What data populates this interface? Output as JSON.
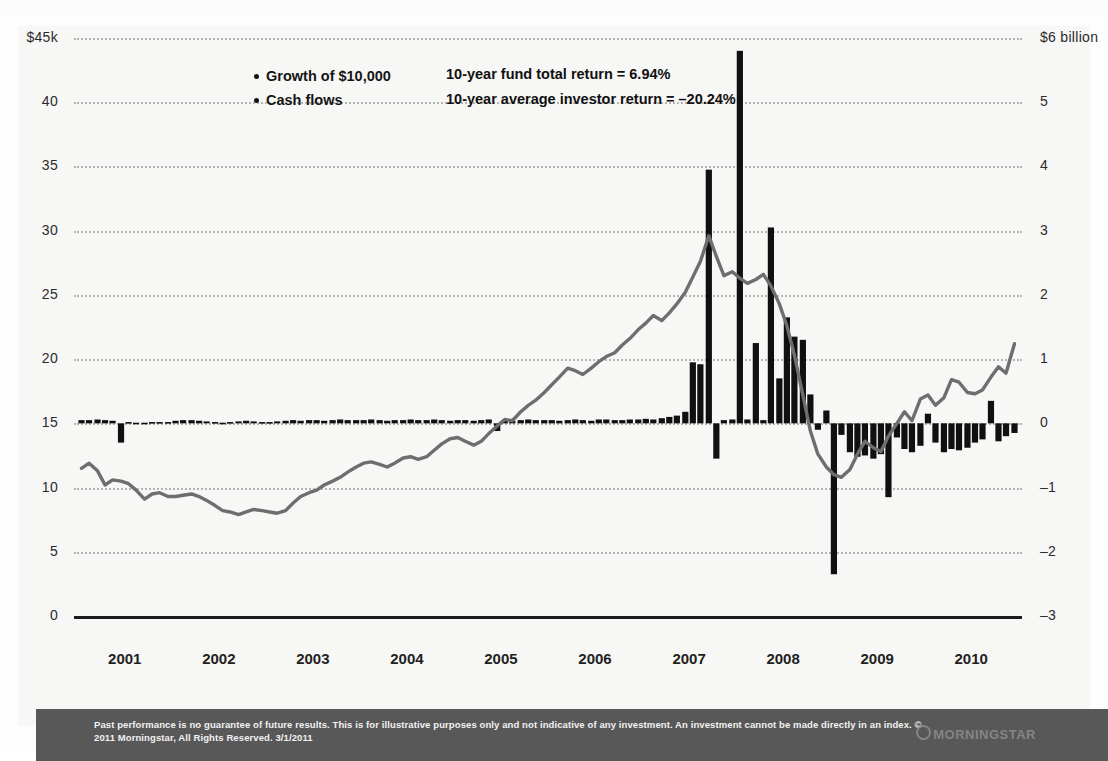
{
  "legend": {
    "items": [
      {
        "label": "Growth of $10,000"
      },
      {
        "label": "Cash flows"
      }
    ]
  },
  "stats": {
    "fund_return": "10-year fund total return = 6.94%",
    "investor_return": "10-year average investor return = –20.24%"
  },
  "footer": {
    "disclaimer": "Past performance is no guarantee of future results. This is for illustrative purposes only and not indicative of any investment. An investment cannot be made directly in an index. © 2011 Morningstar, All Rights Reserved. 3/1/2011",
    "logo": "MORNINGSTAR"
  },
  "chart_data": {
    "type": "line",
    "title": "",
    "xlabel": "",
    "ylabel": "",
    "grid": true,
    "legend_position": "top-left",
    "x": [
      "2001",
      "2002",
      "2003",
      "2004",
      "2005",
      "2006",
      "2007",
      "2008",
      "2009",
      "2010"
    ],
    "xlim": [
      2000.92,
      2011.0
    ],
    "axis_left": {
      "label": "$45k",
      "ticks": [
        "$45k",
        "40",
        "35",
        "30",
        "25",
        "20",
        "15",
        "10",
        "5",
        "0"
      ],
      "tick_values": [
        45,
        40,
        35,
        30,
        25,
        20,
        15,
        10,
        5,
        0
      ],
      "ylim": [
        0,
        45
      ]
    },
    "axis_right": {
      "label": "$6 billion",
      "ticks": [
        "$6 billion",
        "5",
        "4",
        "3",
        "2",
        "1",
        "0",
        "–1",
        "–2",
        "–3"
      ],
      "tick_values": [
        6,
        5,
        4,
        3,
        2,
        1,
        0,
        -1,
        -2,
        -3
      ],
      "ylim": [
        -3,
        6
      ]
    },
    "series": [
      {
        "name": "Growth of $10,000",
        "type": "line",
        "axis": "left",
        "color": "#6e6e6e",
        "x": [
          2001.0,
          2001.08,
          2001.17,
          2001.25,
          2001.33,
          2001.42,
          2001.5,
          2001.58,
          2001.67,
          2001.75,
          2001.83,
          2001.92,
          2002.0,
          2002.08,
          2002.17,
          2002.25,
          2002.33,
          2002.42,
          2002.5,
          2002.58,
          2002.67,
          2002.75,
          2002.83,
          2002.92,
          2003.0,
          2003.08,
          2003.17,
          2003.25,
          2003.33,
          2003.42,
          2003.5,
          2003.58,
          2003.67,
          2003.75,
          2003.83,
          2003.92,
          2004.0,
          2004.08,
          2004.17,
          2004.25,
          2004.33,
          2004.42,
          2004.5,
          2004.58,
          2004.67,
          2004.75,
          2004.83,
          2004.92,
          2005.0,
          2005.08,
          2005.17,
          2005.25,
          2005.33,
          2005.42,
          2005.5,
          2005.58,
          2005.67,
          2005.75,
          2005.83,
          2005.92,
          2006.0,
          2006.08,
          2006.17,
          2006.25,
          2006.33,
          2006.42,
          2006.5,
          2006.58,
          2006.67,
          2006.75,
          2006.83,
          2006.92,
          2007.0,
          2007.08,
          2007.17,
          2007.25,
          2007.33,
          2007.42,
          2007.5,
          2007.58,
          2007.67,
          2007.75,
          2007.83,
          2007.92,
          2008.0,
          2008.08,
          2008.17,
          2008.25,
          2008.33,
          2008.42,
          2008.5,
          2008.58,
          2008.67,
          2008.75,
          2008.83,
          2008.92,
          2009.0,
          2009.08,
          2009.17,
          2009.25,
          2009.33,
          2009.42,
          2009.5,
          2009.58,
          2009.67,
          2009.75,
          2009.83,
          2009.92,
          2010.0,
          2010.08,
          2010.17,
          2010.25,
          2010.33,
          2010.42,
          2010.5,
          2010.58,
          2010.67,
          2010.75,
          2010.83,
          2010.92
        ],
        "y": [
          11.5,
          11.9,
          11.3,
          10.2,
          10.6,
          10.5,
          10.3,
          9.8,
          9.1,
          9.5,
          9.6,
          9.3,
          9.3,
          9.4,
          9.5,
          9.3,
          9.0,
          8.6,
          8.2,
          8.1,
          7.9,
          8.1,
          8.3,
          8.2,
          8.1,
          8.0,
          8.2,
          8.8,
          9.3,
          9.6,
          9.8,
          10.2,
          10.5,
          10.8,
          11.2,
          11.6,
          11.9,
          12.0,
          11.8,
          11.6,
          11.9,
          12.3,
          12.4,
          12.2,
          12.4,
          12.9,
          13.4,
          13.8,
          13.9,
          13.6,
          13.3,
          13.6,
          14.2,
          14.8,
          15.3,
          15.2,
          15.9,
          16.4,
          16.8,
          17.4,
          18.0,
          18.6,
          19.3,
          19.1,
          18.8,
          19.3,
          19.8,
          20.2,
          20.5,
          21.1,
          21.6,
          22.3,
          22.8,
          23.4,
          23.0,
          23.6,
          24.3,
          25.2,
          26.4,
          27.6,
          29.6,
          28.0,
          26.5,
          26.8,
          26.3,
          25.9,
          26.2,
          26.6,
          25.7,
          24.3,
          22.6,
          20.3,
          17.2,
          14.4,
          12.6,
          11.6,
          11.0,
          10.8,
          11.4,
          12.6,
          13.6,
          13.1,
          12.8,
          14.0,
          15.0,
          15.9,
          15.2,
          16.9,
          17.2,
          16.4,
          17.0,
          18.4,
          18.2,
          17.4,
          17.3,
          17.6,
          18.6,
          19.4,
          18.9,
          21.2
        ]
      },
      {
        "name": "Cash flows",
        "type": "bar",
        "axis": "right",
        "color": "#101010",
        "x": [
          2001.0,
          2001.08,
          2001.17,
          2001.25,
          2001.33,
          2001.42,
          2001.5,
          2001.58,
          2001.67,
          2001.75,
          2001.83,
          2001.92,
          2002.0,
          2002.08,
          2002.17,
          2002.25,
          2002.33,
          2002.42,
          2002.5,
          2002.58,
          2002.67,
          2002.75,
          2002.83,
          2002.92,
          2003.0,
          2003.08,
          2003.17,
          2003.25,
          2003.33,
          2003.42,
          2003.5,
          2003.58,
          2003.67,
          2003.75,
          2003.83,
          2003.92,
          2004.0,
          2004.08,
          2004.17,
          2004.25,
          2004.33,
          2004.42,
          2004.5,
          2004.58,
          2004.67,
          2004.75,
          2004.83,
          2004.92,
          2005.0,
          2005.08,
          2005.17,
          2005.25,
          2005.33,
          2005.42,
          2005.5,
          2005.58,
          2005.67,
          2005.75,
          2005.83,
          2005.92,
          2006.0,
          2006.08,
          2006.17,
          2006.25,
          2006.33,
          2006.42,
          2006.5,
          2006.58,
          2006.67,
          2006.75,
          2006.83,
          2006.92,
          2007.0,
          2007.08,
          2007.17,
          2007.25,
          2007.33,
          2007.42,
          2007.5,
          2007.58,
          2007.67,
          2007.75,
          2007.83,
          2007.92,
          2008.0,
          2008.08,
          2008.17,
          2008.25,
          2008.33,
          2008.42,
          2008.5,
          2008.58,
          2008.67,
          2008.75,
          2008.83,
          2008.92,
          2009.0,
          2009.08,
          2009.17,
          2009.25,
          2009.33,
          2009.42,
          2009.5,
          2009.58,
          2009.67,
          2009.75,
          2009.83,
          2009.92,
          2010.0,
          2010.08,
          2010.17,
          2010.25,
          2010.33,
          2010.42,
          2010.5,
          2010.58,
          2010.67,
          2010.75,
          2010.83,
          2010.92
        ],
        "y": [
          0.05,
          0.05,
          0.06,
          0.05,
          0.04,
          -0.3,
          0.02,
          0.01,
          0.01,
          0.02,
          0.02,
          0.02,
          0.04,
          0.05,
          0.05,
          0.04,
          0.03,
          0.02,
          0.01,
          0.02,
          0.03,
          0.04,
          0.03,
          0.02,
          0.02,
          0.03,
          0.04,
          0.05,
          0.04,
          0.05,
          0.05,
          0.04,
          0.05,
          0.06,
          0.05,
          0.05,
          0.05,
          0.06,
          0.05,
          0.04,
          0.05,
          0.05,
          0.06,
          0.05,
          0.05,
          0.06,
          0.05,
          0.04,
          0.05,
          0.05,
          0.04,
          0.05,
          0.06,
          -0.12,
          0.05,
          0.04,
          0.05,
          0.06,
          0.05,
          0.05,
          0.05,
          0.04,
          0.05,
          0.06,
          0.05,
          0.04,
          0.06,
          0.06,
          0.05,
          0.05,
          0.06,
          0.06,
          0.07,
          0.06,
          0.08,
          0.1,
          0.12,
          0.18,
          0.95,
          0.92,
          3.95,
          -0.55,
          0.05,
          0.06,
          5.8,
          0.06,
          1.25,
          0.05,
          3.05,
          0.7,
          1.65,
          1.35,
          1.3,
          0.45,
          -0.1,
          0.2,
          -2.35,
          -0.18,
          -0.45,
          -0.52,
          -0.5,
          -0.55,
          -0.48,
          -1.15,
          -0.22,
          -0.4,
          -0.45,
          -0.35,
          0.15,
          -0.3,
          -0.45,
          -0.4,
          -0.42,
          -0.38,
          -0.3,
          -0.25,
          0.35,
          -0.28,
          -0.2,
          -0.15
        ]
      }
    ],
    "annotations": [
      "10-year fund total return = 6.94%",
      "10-year average investor return = –20.24%"
    ]
  }
}
